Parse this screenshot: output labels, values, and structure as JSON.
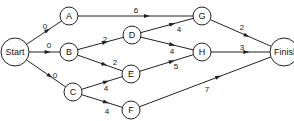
{
  "diagram": {
    "type": "network-activity-graph",
    "nodes": [
      {
        "id": "Start",
        "label": "Start",
        "x": 15,
        "y": 52,
        "r": 14
      },
      {
        "id": "A",
        "label": "A",
        "x": 69,
        "y": 16,
        "r": 9
      },
      {
        "id": "B",
        "label": "B",
        "x": 69,
        "y": 52,
        "r": 9
      },
      {
        "id": "C",
        "label": "C",
        "x": 73,
        "y": 92,
        "r": 9
      },
      {
        "id": "D",
        "label": "D",
        "x": 132,
        "y": 35,
        "r": 9
      },
      {
        "id": "E",
        "label": "E",
        "x": 131,
        "y": 74,
        "r": 9
      },
      {
        "id": "F",
        "label": "F",
        "x": 131,
        "y": 110,
        "r": 9
      },
      {
        "id": "G",
        "label": "G",
        "x": 202,
        "y": 16,
        "r": 9
      },
      {
        "id": "H",
        "label": "H",
        "x": 202,
        "y": 52,
        "r": 9
      },
      {
        "id": "Finish",
        "label": "Finish",
        "x": 284,
        "y": 52,
        "r": 14
      }
    ],
    "edges": [
      {
        "from": "Start",
        "to": "A",
        "weight": "0",
        "lx": 45,
        "ly": 26
      },
      {
        "from": "Start",
        "to": "B",
        "weight": "0",
        "lx": 49,
        "ly": 45
      },
      {
        "from": "Start",
        "to": "C",
        "weight": "0",
        "lx": 55,
        "ly": 75
      },
      {
        "from": "A",
        "to": "G",
        "weight": "6",
        "lx": 136,
        "ly": 10
      },
      {
        "from": "B",
        "to": "D",
        "weight": "2",
        "lx": 105,
        "ly": 39
      },
      {
        "from": "B",
        "to": "E",
        "weight": "2",
        "lx": 115,
        "ly": 62
      },
      {
        "from": "C",
        "to": "E",
        "weight": "4",
        "lx": 106,
        "ly": 88
      },
      {
        "from": "C",
        "to": "F",
        "weight": "4",
        "lx": 107,
        "ly": 111
      },
      {
        "from": "D",
        "to": "G",
        "weight": "4",
        "lx": 179,
        "ly": 29
      },
      {
        "from": "D",
        "to": "H",
        "weight": "4",
        "lx": 172,
        "ly": 51
      },
      {
        "from": "E",
        "to": "H",
        "weight": "5",
        "lx": 176,
        "ly": 66
      },
      {
        "from": "G",
        "to": "Finish",
        "weight": "2",
        "lx": 242,
        "ly": 27
      },
      {
        "from": "H",
        "to": "Finish",
        "weight": "3",
        "lx": 242,
        "ly": 47
      },
      {
        "from": "F",
        "to": "Finish",
        "weight": "7",
        "lx": 207,
        "ly": 89
      }
    ]
  }
}
